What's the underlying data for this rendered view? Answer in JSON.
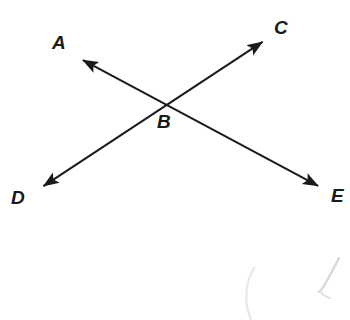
{
  "figure": {
    "type": "geometry-diagram",
    "width": 350,
    "height": 320,
    "background_color": "#ffffff",
    "stroke_color": "#1a1a1a",
    "stroke_width": 2
  },
  "labels": [
    {
      "id": "A",
      "text": "A",
      "x": 52,
      "y": 33
    },
    {
      "id": "B",
      "text": "B",
      "x": 157,
      "y": 112
    },
    {
      "id": "C",
      "text": "C",
      "x": 274,
      "y": 18
    },
    {
      "id": "D",
      "text": "D",
      "x": 11,
      "y": 188
    },
    {
      "id": "E",
      "text": "E",
      "x": 331,
      "y": 186
    }
  ],
  "points": {
    "A": {
      "x": 75,
      "y": 56
    },
    "B": {
      "x": 168,
      "y": 105
    },
    "C": {
      "x": 270,
      "y": 37
    },
    "D": {
      "x": 36,
      "y": 191
    },
    "E": {
      "x": 326,
      "y": 190
    }
  },
  "lines": [
    {
      "id": "line-DC",
      "name": "line-d-c",
      "from": "D",
      "to": "C",
      "from_point": {
        "x": 36,
        "y": 191
      },
      "to_point": {
        "x": 270,
        "y": 37
      },
      "double_headed": true
    },
    {
      "id": "line-AE",
      "name": "line-a-e",
      "from": "A",
      "to": "E",
      "from_point": {
        "x": 75,
        "y": 56
      },
      "to_point": {
        "x": 326,
        "y": 190
      },
      "double_headed": true
    }
  ],
  "artifacts": [
    {
      "id": "smudge-left",
      "d": "M 254 268 C 248 278, 245 292, 247 306 C 248 313, 250 317, 251 320",
      "color": "#e8e8e8",
      "width": 2.2
    },
    {
      "id": "smudge-right",
      "d": "M 339 258 C 335 266, 329 277, 324 286 C 322 289, 320 291, 319 292",
      "color": "#d8d8d8",
      "width": 2.4
    },
    {
      "id": "smudge-right-tail",
      "d": "M 320 291 C 322 294, 326 297, 330 298",
      "color": "#e0e0e0",
      "width": 2.0
    }
  ]
}
